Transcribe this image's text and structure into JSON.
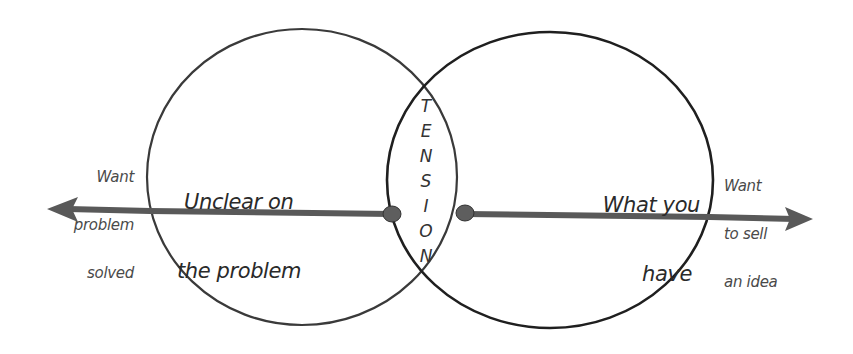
{
  "diagram": {
    "type": "venn",
    "left_circle": {
      "label_line1": "Unclear on",
      "label_line2": "the problem"
    },
    "right_circle": {
      "label_line1": "What you",
      "label_line2": "have"
    },
    "overlap": {
      "label": "TENSION",
      "letters": [
        "T",
        "E",
        "N",
        "S",
        "I",
        "O",
        "N"
      ]
    },
    "left_arrow": {
      "direction": "left",
      "label_line1": "Want",
      "label_line2": "problem",
      "label_line3": "solved"
    },
    "right_arrow": {
      "direction": "right",
      "label_line1": "Want",
      "label_line2": "to sell",
      "label_line3": "an idea"
    },
    "colors": {
      "background": "#ffffff",
      "circle_stroke": "#2b2b2b",
      "arrow": "#555555",
      "side_text": "#4a4a4a",
      "main_text": "#2a2a2a"
    }
  }
}
